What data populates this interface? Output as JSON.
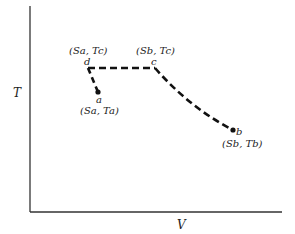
{
  "diagram": {
    "axes": {
      "x_label": "V",
      "y_label": "T"
    },
    "points": {
      "a": {
        "name": "a",
        "coord": "(Sa, Ta)"
      },
      "b": {
        "name": "b",
        "coord": "(Sb, Tb)"
      },
      "c": {
        "name": "c",
        "coord": "(Sb, Tc)"
      },
      "d": {
        "name": "d",
        "coord": "(Sa, Tc)"
      }
    },
    "paths": [
      {
        "from": "a",
        "to": "d",
        "style": "dashed"
      },
      {
        "from": "d",
        "to": "c",
        "style": "dashed"
      },
      {
        "from": "c",
        "to": "b",
        "style": "dashed-curve"
      }
    ],
    "colors": {
      "line": "#111111",
      "axis": "#333333"
    }
  }
}
